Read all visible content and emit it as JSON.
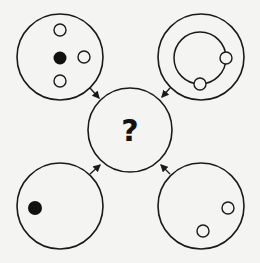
{
  "puzzle": {
    "center_label": "?",
    "stroke_color": "#1a1a1a",
    "background_color": "#f4f4f2"
  },
  "panels": [
    {
      "name": "top-left",
      "description": "Circle with one filled dot and three open dots",
      "small_circles": [
        {
          "type": "open",
          "cx": 60,
          "cy": 30
        },
        {
          "type": "filled",
          "cx": 60,
          "cy": 58
        },
        {
          "type": "open",
          "cx": 84,
          "cy": 57
        },
        {
          "type": "open",
          "cx": 60,
          "cy": 81
        }
      ]
    },
    {
      "name": "top-right",
      "description": "Circle containing an inner ring with two open dots on it",
      "inner_ring": true,
      "small_circles": [
        {
          "type": "open",
          "cx": 226,
          "cy": 58
        },
        {
          "type": "open",
          "cx": 200,
          "cy": 84
        }
      ]
    },
    {
      "name": "bottom-left",
      "description": "Circle with one filled dot",
      "small_circles": [
        {
          "type": "filled",
          "cx": 35,
          "cy": 208
        }
      ]
    },
    {
      "name": "bottom-right",
      "description": "Circle with two open dots",
      "small_circles": [
        {
          "type": "open",
          "cx": 228,
          "cy": 208
        },
        {
          "type": "open",
          "cx": 203,
          "cy": 231
        }
      ]
    }
  ]
}
